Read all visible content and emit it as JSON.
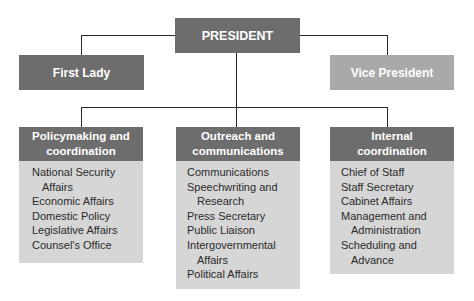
{
  "top": {
    "president": "PRESIDENT",
    "first_lady": "First Lady",
    "vice_president": "Vice President"
  },
  "panels": [
    {
      "title_line1": "Policymaking and",
      "title_line2": "coordination",
      "items": [
        {
          "line1": "National Security",
          "line2": "Affairs"
        },
        {
          "line1": "Economic Affairs"
        },
        {
          "line1": "Domestic Policy"
        },
        {
          "line1": "Legislative Affairs"
        },
        {
          "line1": "Counsel's Office"
        }
      ]
    },
    {
      "title_line1": "Outreach and",
      "title_line2": "communications",
      "items": [
        {
          "line1": "Communications"
        },
        {
          "line1": "Speechwriting and",
          "line2": "Research"
        },
        {
          "line1": "Press Secretary"
        },
        {
          "line1": "Public Liaison"
        },
        {
          "line1": "Intergovernmental",
          "line2": "Affairs"
        },
        {
          "line1": "Political Affairs"
        }
      ]
    },
    {
      "title_line1": "Internal",
      "title_line2": "coordination",
      "items": [
        {
          "line1": "Chief of Staff"
        },
        {
          "line1": "Staff Secretary"
        },
        {
          "line1": "Cabinet Affairs"
        },
        {
          "line1": "Management and",
          "line2": "Administration"
        },
        {
          "line1": "Scheduling and",
          "line2": "Advance"
        }
      ]
    }
  ]
}
